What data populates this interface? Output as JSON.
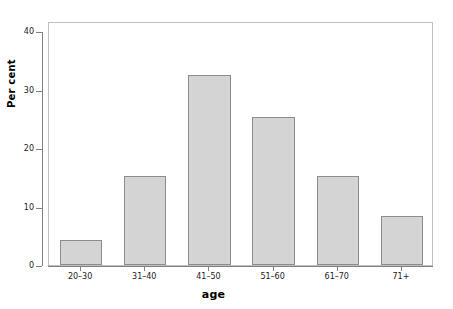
{
  "chart_data": {
    "type": "bar",
    "title": "",
    "subtitle": "",
    "xlabel": "age",
    "ylabel": "Per cent",
    "categories": [
      "20–30",
      "31–40",
      "41–50",
      "51–60",
      "61–70",
      "71+"
    ],
    "values": [
      4.2,
      15.2,
      32.4,
      25.3,
      15.2,
      8.3
    ],
    "series": [
      {
        "name": "Per cent",
        "values": [
          4.2,
          15.2,
          32.4,
          25.3,
          15.2,
          8.3
        ]
      }
    ],
    "ylim": [
      0,
      42
    ],
    "xlim": [
      0,
      6
    ],
    "yticks": [
      0,
      10,
      20,
      30,
      40
    ],
    "ytick_labels": [
      "0",
      "10",
      "20",
      "30",
      "40"
    ],
    "xtick_labels": [
      "20–30",
      "31–40",
      "41–50",
      "51–60",
      "61–70",
      "71+"
    ],
    "grid": false,
    "legend": null,
    "legend_position": "none",
    "annotations": [],
    "bar_fill_color": "#d4d4d4",
    "bar_edge_color": "#8c8c8c",
    "panel_border_color": "#bfbfbf",
    "axis_color": "#808080",
    "background_color": "#ffffff",
    "text_color": "#1a1a1a"
  },
  "figure": {
    "y_axis_title": "Per cent",
    "x_axis_title": "age"
  }
}
